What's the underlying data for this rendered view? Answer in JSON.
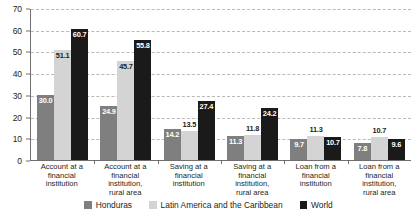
{
  "chart_data": {
    "type": "bar",
    "title": "",
    "subtitle": "",
    "xlabel": "",
    "ylabel": "",
    "ylim": [
      0,
      70
    ],
    "ytick_step": 10,
    "yticks": [
      "0",
      "10",
      "20",
      "30",
      "40",
      "50",
      "60",
      "70"
    ],
    "grid": true,
    "grid_style": "dashed-horizontal",
    "legend_position": "bottom-center",
    "categories": [
      "Account at a financial institution",
      "Account at a financial institution, rural area",
      "Saving at a financial institution",
      "Saving at a financial institution, rural area",
      "Loan from a financial institution",
      "Loan from a financial institution, rural area"
    ],
    "category_lines": [
      [
        "Account at a",
        "financial",
        "institution"
      ],
      [
        "Account at a",
        "financial",
        "institution,",
        "rural area"
      ],
      [
        "Saving at a",
        "financial",
        "institution"
      ],
      [
        "Saving at a",
        "financial",
        "institution,",
        "rural area"
      ],
      [
        "Loan from a",
        "financial",
        "institution"
      ],
      [
        "Loan from a",
        "financial",
        "institution,",
        "rural area"
      ]
    ],
    "series": [
      {
        "name": "Honduras",
        "color": "#7f7f7f",
        "values": [
          30.0,
          24.9,
          14.2,
          11.3,
          9.7,
          7.8
        ],
        "labels": [
          "30.0",
          "24.9",
          "14.2",
          "11.3",
          "9.7",
          "7.8"
        ]
      },
      {
        "name": "Latin America and the Caribbean",
        "color": "#d4d4d4",
        "values": [
          51.1,
          45.7,
          13.5,
          11.8,
          11.3,
          10.7
        ],
        "labels": [
          "51.1",
          "45.7",
          "13.5",
          "11.8",
          "11.3",
          "10.7"
        ]
      },
      {
        "name": "World",
        "color": "#1a1a1a",
        "values": [
          60.7,
          55.8,
          27.4,
          24.2,
          10.7,
          9.6
        ],
        "labels": [
          "60.7",
          "55.8",
          "27.4",
          "24.2",
          "10.7",
          "9.6"
        ]
      }
    ]
  }
}
